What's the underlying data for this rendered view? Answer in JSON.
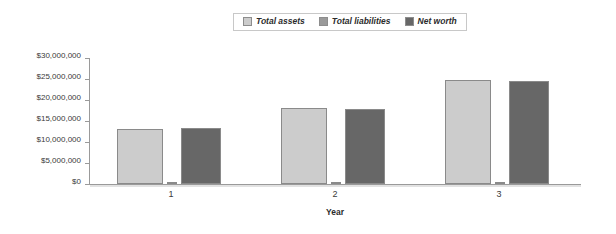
{
  "chart_data": {
    "type": "bar",
    "title": "",
    "subtitle": "",
    "xlabel": "Year",
    "ylabel": "",
    "categories": [
      "1",
      "2",
      "3"
    ],
    "series": [
      {
        "name": "Total assets",
        "color": "#cccccc",
        "values": [
          13000000,
          18000000,
          24800000
        ]
      },
      {
        "name": "Total liabilities",
        "color": "#9a9a9a",
        "values": [
          100000,
          150000,
          200000
        ]
      },
      {
        "name": "Net worth",
        "color": "#676767",
        "values": [
          13300000,
          17900000,
          24600000
        ]
      }
    ],
    "ylim": [
      0,
      30000000
    ],
    "ytick_values": [
      0,
      5000000,
      10000000,
      15000000,
      20000000,
      25000000,
      30000000
    ],
    "ytick_labels": [
      "$0",
      "$5,000,000",
      "$10,000,000",
      "$15,000,000",
      "$20,000,000",
      "$25,000,000",
      "$30,000,000"
    ],
    "grid": false,
    "legend_position": "top-center",
    "legend_entries": [
      "Total assets",
      "Total liabilities",
      "Net worth"
    ]
  },
  "legend": {
    "items": [
      {
        "label": "Total assets"
      },
      {
        "label": "Total liabilities"
      },
      {
        "label": "Net worth"
      }
    ]
  },
  "axes": {
    "x_title": "Year",
    "x_labels": [
      "1",
      "2",
      "3"
    ],
    "y_labels": [
      "$30,000,000",
      "$25,000,000",
      "$20,000,000",
      "$15,000,000",
      "$10,000,000",
      "$5,000,000",
      "$0"
    ]
  }
}
